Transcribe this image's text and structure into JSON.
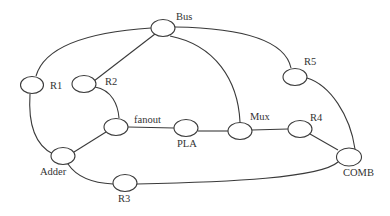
{
  "diagram": {
    "type": "graph",
    "nodes": [
      {
        "id": "bus",
        "label": "Bus"
      },
      {
        "id": "r1",
        "label": "R1"
      },
      {
        "id": "r2",
        "label": "R2"
      },
      {
        "id": "r5",
        "label": "R5"
      },
      {
        "id": "fanout",
        "label": "fanout"
      },
      {
        "id": "pla",
        "label": "PLA"
      },
      {
        "id": "mux",
        "label": "Mux"
      },
      {
        "id": "r4",
        "label": "R4"
      },
      {
        "id": "adder",
        "label": "Adder"
      },
      {
        "id": "r3",
        "label": "R3"
      },
      {
        "id": "comb",
        "label": "COMB"
      }
    ],
    "edges": [
      [
        "bus",
        "r1"
      ],
      [
        "bus",
        "r2"
      ],
      [
        "bus",
        "mux"
      ],
      [
        "bus",
        "r5"
      ],
      [
        "r1",
        "adder"
      ],
      [
        "r2",
        "fanout"
      ],
      [
        "fanout",
        "adder"
      ],
      [
        "fanout",
        "pla"
      ],
      [
        "pla",
        "mux"
      ],
      [
        "mux",
        "r4"
      ],
      [
        "r4",
        "comb"
      ],
      [
        "r5",
        "comb"
      ],
      [
        "adder",
        "r3"
      ],
      [
        "r3",
        "comb"
      ]
    ]
  }
}
